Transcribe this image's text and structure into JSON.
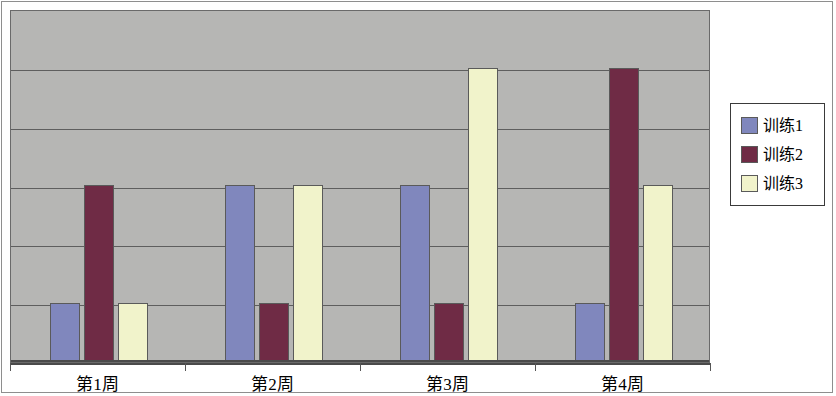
{
  "chart_data": {
    "type": "bar",
    "title": "",
    "subtitle": "",
    "xlabel": "",
    "ylabel": "",
    "categories": [
      "第1周",
      "第2周",
      "第3周",
      "第4周"
    ],
    "series": [
      {
        "name": "训练1",
        "color": "#8087bd",
        "values": [
          1,
          3,
          3,
          1
        ]
      },
      {
        "name": "训练2",
        "color": "#6f2b45",
        "values": [
          3,
          1,
          1,
          5
        ]
      },
      {
        "name": "训练3",
        "color": "#f1f3cb",
        "values": [
          1,
          3,
          5,
          3
        ]
      }
    ],
    "ylim": [
      0,
      6
    ],
    "y_gridline_count": 5,
    "y_tick_labels": [],
    "grid": true,
    "legend_position": "right",
    "plot_background": "#b6b6b4",
    "figure_background": "#ffffff",
    "gridline_color": "#5e5e5e",
    "axis_color": "#4a4a4a"
  },
  "legend": {
    "items": [
      {
        "label": "训练1",
        "color": "#8087bd"
      },
      {
        "label": "训练2",
        "color": "#6f2b45"
      },
      {
        "label": "训练3",
        "color": "#f1f3cb"
      }
    ]
  },
  "axis": {
    "x_labels": [
      "第1周",
      "第2周",
      "第3周",
      "第4周"
    ]
  }
}
